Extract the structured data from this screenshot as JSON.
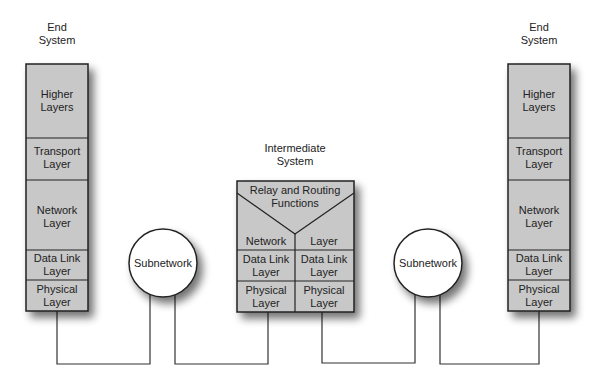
{
  "diagram": {
    "left_system": {
      "title_line1": "End",
      "title_line2": "System",
      "layers": [
        {
          "line1": "Higher",
          "line2": "Layers"
        },
        {
          "line1": "Transport",
          "line2": "Layer"
        },
        {
          "line1": "Network",
          "line2": "Layer"
        },
        {
          "line1": "Data Link",
          "line2": "Layer"
        },
        {
          "line1": "Physical",
          "line2": "Layer"
        }
      ]
    },
    "right_system": {
      "title_line1": "End",
      "title_line2": "System",
      "layers": [
        {
          "line1": "Higher",
          "line2": "Layers"
        },
        {
          "line1": "Transport",
          "line2": "Layer"
        },
        {
          "line1": "Network",
          "line2": "Layer"
        },
        {
          "line1": "Data Link",
          "line2": "Layer"
        },
        {
          "line1": "Physical",
          "line2": "Layer"
        }
      ]
    },
    "intermediate_system": {
      "title_line1": "Intermediate",
      "title_line2": "System",
      "relay_line1": "Relay and Routing",
      "relay_line2": "Functions",
      "network_left": "Network",
      "network_right": "Layer",
      "datalink_line1": "Data Link",
      "datalink_line2": "Layer",
      "physical_line1": "Physical",
      "physical_line2": "Layer"
    },
    "subnetwork_left": "Subnetwork",
    "subnetwork_right": "Subnetwork",
    "colors": {
      "box_fill": "#c8c8c8",
      "border": "#222222",
      "circle_fill": "#ffffff",
      "line": "#333333"
    }
  }
}
